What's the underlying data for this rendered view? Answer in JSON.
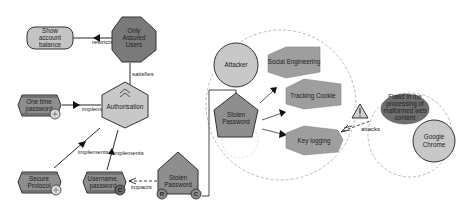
{
  "diagram": {
    "colors": {
      "light_gray": "#c8c8c8",
      "dark_gray": "#7a7a7a",
      "medium_gray": "#9e9e9e",
      "stroke": "#333333",
      "dashed": "#aaaaaa"
    },
    "nodes": {
      "show_account_balance": {
        "line1": "Show",
        "line2": "account",
        "line3": "balance"
      },
      "only_assured_users": {
        "line1": "Only",
        "line2": "Assured",
        "line3": "Users"
      },
      "authorisation": {
        "label": "Authorisation"
      },
      "one_time_password": {
        "line1": "One time",
        "line2": "password"
      },
      "secure_protocol": {
        "line1": "Secure",
        "line2": "Protocol"
      },
      "username_password": {
        "line1": "Username,",
        "line2": "password"
      },
      "stolen_password_left": {
        "line1": "Stolen",
        "line2": "Password",
        "badge_left": "R",
        "badge_right": "C"
      },
      "attacker": {
        "label": "Attacker"
      },
      "stolen_password_center": {
        "line1": "Stolen",
        "line2": "Password"
      },
      "social_engineering": {
        "label": "Social Engineering"
      },
      "tracking_cookie": {
        "label": "Tracking Cookie"
      },
      "key_logging": {
        "label": "Key logging"
      },
      "flaws": {
        "line1": "Flaws in the",
        "line2": "processing of",
        "line3": "malformed web",
        "line4": "content"
      },
      "google_chrome": {
        "line1": "Google",
        "line2": "Chrome"
      }
    },
    "edges": {
      "restricts": "restricts",
      "satisfies": "satisfies",
      "implements_otp": "implements",
      "implements_secure": "implements",
      "implements_username": "implements",
      "impacts": "impacts",
      "attacks": "attacks"
    },
    "badges": {
      "username_badge": "C"
    }
  }
}
